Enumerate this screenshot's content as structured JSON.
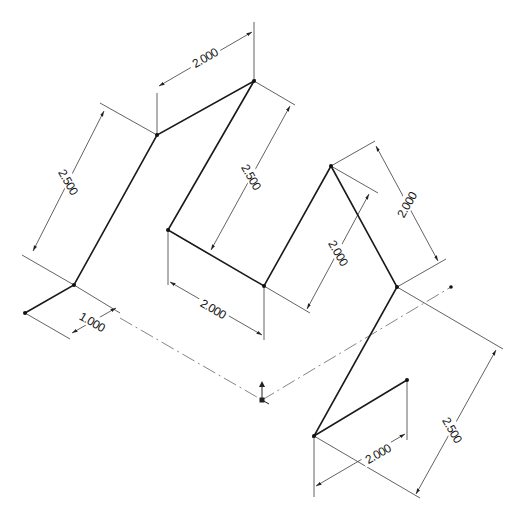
{
  "drawing": {
    "type": "isometric 3D sketch",
    "dimensions": [
      {
        "id": "d1",
        "value": "2.000"
      },
      {
        "id": "d2",
        "value": "2.500"
      },
      {
        "id": "d3",
        "value": "1.000"
      },
      {
        "id": "d4",
        "value": "2.500"
      },
      {
        "id": "d5",
        "value": "2.000"
      },
      {
        "id": "d6",
        "value": "2.000"
      },
      {
        "id": "d7",
        "value": "2.000"
      },
      {
        "id": "d8",
        "value": "2.000"
      },
      {
        "id": "d9",
        "value": "2.500"
      }
    ],
    "colors": {
      "geometry": "#1a1a1a",
      "dimension": "#3a3a3a",
      "centerline": "#777777",
      "background": "#ffffff"
    }
  }
}
